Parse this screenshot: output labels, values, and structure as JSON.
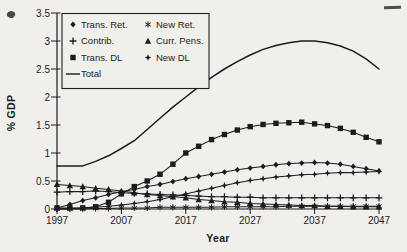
{
  "chart_data": {
    "type": "line",
    "title": "",
    "xlabel": "Year",
    "ylabel": "% GDP",
    "xlim": [
      1997,
      2047
    ],
    "ylim": [
      0,
      3.5
    ],
    "grid": false,
    "x_ticks": [
      1997,
      2007,
      2017,
      2027,
      2037,
      2047
    ],
    "x_tick_labels": [
      "1997",
      "2007",
      "2017",
      "2027",
      "2037",
      "2047"
    ],
    "y_ticks": [
      0,
      0.5,
      1,
      1.5,
      2,
      2.5,
      3,
      3.5
    ],
    "y_tick_labels": [
      "0",
      "0.5",
      "1",
      "1.5",
      "2",
      "2.5",
      "3",
      "3.5"
    ],
    "x": [
      1997,
      1999,
      2001,
      2003,
      2005,
      2007,
      2009,
      2011,
      2013,
      2015,
      2017,
      2019,
      2021,
      2023,
      2025,
      2027,
      2029,
      2031,
      2033,
      2035,
      2037,
      2039,
      2041,
      2043,
      2045,
      2047
    ],
    "series": [
      {
        "name": "Trans. Ret.",
        "marker": "diamond",
        "values": [
          0.02,
          0.08,
          0.15,
          0.2,
          0.26,
          0.31,
          0.35,
          0.4,
          0.44,
          0.49,
          0.54,
          0.58,
          0.62,
          0.66,
          0.7,
          0.73,
          0.76,
          0.79,
          0.81,
          0.82,
          0.83,
          0.82,
          0.8,
          0.76,
          0.72,
          0.68
        ]
      },
      {
        "name": "New Ret.",
        "marker": "asterisk",
        "values": [
          0.0,
          0.0,
          0.0,
          0.01,
          0.01,
          0.02,
          0.02,
          0.02,
          0.03,
          0.03,
          0.03,
          0.03,
          0.03,
          0.04,
          0.04,
          0.04,
          0.04,
          0.04,
          0.05,
          0.05,
          0.05,
          0.05,
          0.05,
          0.05,
          0.05,
          0.05
        ]
      },
      {
        "name": "Contrib.",
        "marker": "plus",
        "values": [
          0.3,
          0.31,
          0.31,
          0.32,
          0.31,
          0.29,
          0.28,
          0.27,
          0.26,
          0.25,
          0.24,
          0.23,
          0.22,
          0.22,
          0.21,
          0.21,
          0.2,
          0.2,
          0.2,
          0.2,
          0.2,
          0.2,
          0.2,
          0.2,
          0.2,
          0.2
        ]
      },
      {
        "name": "Curr. Pens.",
        "marker": "triangle",
        "values": [
          0.44,
          0.42,
          0.4,
          0.37,
          0.35,
          0.32,
          0.29,
          0.26,
          0.24,
          0.22,
          0.2,
          0.17,
          0.15,
          0.13,
          0.12,
          0.1,
          0.09,
          0.08,
          0.07,
          0.06,
          0.06,
          0.05,
          0.05,
          0.04,
          0.04,
          0.04
        ]
      },
      {
        "name": "Trans. DL",
        "marker": "square",
        "values": [
          0.02,
          0.02,
          0.02,
          0.04,
          0.12,
          0.27,
          0.4,
          0.5,
          0.62,
          0.8,
          1.0,
          1.12,
          1.24,
          1.33,
          1.41,
          1.47,
          1.51,
          1.53,
          1.54,
          1.55,
          1.52,
          1.49,
          1.44,
          1.37,
          1.28,
          1.2
        ]
      },
      {
        "name": "New DL",
        "marker": "star4",
        "values": [
          0.0,
          0.01,
          0.02,
          0.03,
          0.05,
          0.07,
          0.1,
          0.13,
          0.17,
          0.22,
          0.27,
          0.32,
          0.37,
          0.42,
          0.47,
          0.51,
          0.54,
          0.57,
          0.59,
          0.61,
          0.62,
          0.64,
          0.65,
          0.65,
          0.66,
          0.67
        ]
      },
      {
        "name": "Total",
        "marker": "none",
        "values": [
          0.77,
          0.77,
          0.77,
          0.85,
          0.95,
          1.08,
          1.22,
          1.42,
          1.62,
          1.82,
          2.0,
          2.18,
          2.35,
          2.5,
          2.63,
          2.75,
          2.85,
          2.92,
          2.97,
          3.0,
          3.0,
          2.97,
          2.91,
          2.82,
          2.68,
          2.5
        ]
      }
    ],
    "legend": {
      "position": "top-left",
      "columns": [
        [
          "Trans. Ret.",
          "Contrib.",
          "Trans. DL",
          "Total"
        ],
        [
          "New Ret.",
          "Curr. Pens.",
          "New DL"
        ]
      ]
    },
    "colors": {
      "ink": "#1c1c1c",
      "paper": "#f1efeb"
    }
  }
}
